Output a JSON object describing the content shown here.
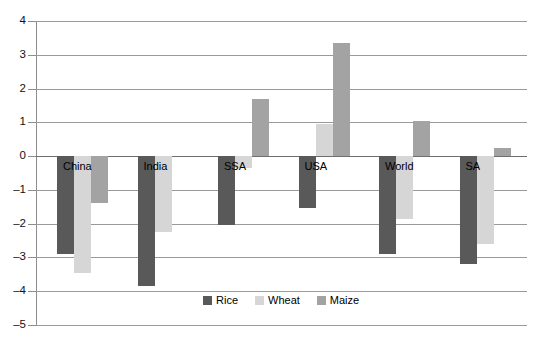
{
  "chart_data": {
    "type": "bar",
    "title": "",
    "subtitle": "",
    "xlabel": "",
    "ylabel": "",
    "categories": [
      "China",
      "India",
      "SSA",
      "USA",
      "World",
      "SA"
    ],
    "series": [
      {
        "name": "Rice",
        "color": "#595959",
        "values": [
          -2.9,
          -3.85,
          -2.05,
          -1.55,
          -2.9,
          -3.2
        ]
      },
      {
        "name": "Wheat",
        "color": "#d6d6d6",
        "values": [
          -3.45,
          -2.25,
          -0.35,
          0.95,
          -1.85,
          -2.6
        ]
      },
      {
        "name": "Maize",
        "color": "#a3a3a3",
        "values": [
          -1.4,
          0,
          1.7,
          3.35,
          1.05,
          0.25
        ]
      }
    ],
    "ylim": [
      -5,
      4
    ],
    "yticks": [
      4,
      3,
      2,
      1,
      0,
      -1,
      -2,
      -3,
      -4,
      -5
    ],
    "ytick_labels": [
      "4",
      "3",
      "2",
      "1",
      "0",
      "–1",
      "–2",
      "–3",
      "–4",
      "–5"
    ],
    "grid": true,
    "grid_axis": "y",
    "legend_position": "bottom",
    "legend_entries": [
      "Rice",
      "Wheat",
      "Maize"
    ]
  }
}
